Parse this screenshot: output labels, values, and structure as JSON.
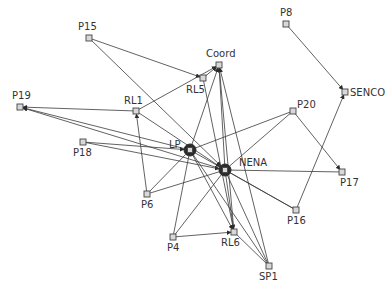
{
  "diagram": {
    "type": "directed-network",
    "background": "#ffffff",
    "edge_color": "#3a3a3a",
    "node_fill": "#d8d8d8",
    "hub_color": "#2b2b2b",
    "nodes": [
      {
        "id": "P15",
        "label": "P15",
        "x": 89,
        "y": 38,
        "lx": 78,
        "ly": 30,
        "hub": false
      },
      {
        "id": "P8",
        "label": "P8",
        "x": 286,
        "y": 24,
        "lx": 280,
        "ly": 16,
        "hub": false
      },
      {
        "id": "Coord",
        "label": "Coord",
        "x": 219,
        "y": 65,
        "lx": 206,
        "ly": 57,
        "hub": false
      },
      {
        "id": "RL5",
        "label": "RL5",
        "x": 203,
        "y": 78,
        "lx": 186,
        "ly": 93,
        "hub": false
      },
      {
        "id": "SENCO",
        "label": "SENCO",
        "x": 345,
        "y": 92,
        "lx": 350,
        "ly": 96,
        "hub": false
      },
      {
        "id": "P19",
        "label": "P19",
        "x": 20,
        "y": 107,
        "lx": 12,
        "ly": 99,
        "hub": false
      },
      {
        "id": "RL1",
        "label": "RL1",
        "x": 136,
        "y": 111,
        "lx": 124,
        "ly": 104,
        "hub": false
      },
      {
        "id": "P20",
        "label": "P20",
        "x": 293,
        "y": 111,
        "lx": 297,
        "ly": 108,
        "hub": false
      },
      {
        "id": "P18",
        "label": "P18",
        "x": 83,
        "y": 142,
        "lx": 73,
        "ly": 156,
        "hub": false
      },
      {
        "id": "LP",
        "label": "LP",
        "x": 190,
        "y": 150,
        "lx": 169,
        "ly": 148,
        "hub": true
      },
      {
        "id": "NENA",
        "label": "NENA",
        "x": 225,
        "y": 170,
        "lx": 239,
        "ly": 166,
        "hub": true
      },
      {
        "id": "P6",
        "label": "P6",
        "x": 147,
        "y": 194,
        "lx": 141,
        "ly": 208,
        "hub": false
      },
      {
        "id": "P17",
        "label": "P17",
        "x": 342,
        "y": 172,
        "lx": 340,
        "ly": 186,
        "hub": false
      },
      {
        "id": "P16",
        "label": "P16",
        "x": 296,
        "y": 210,
        "lx": 287,
        "ly": 224,
        "hub": false
      },
      {
        "id": "P4",
        "label": "P4",
        "x": 173,
        "y": 237,
        "lx": 167,
        "ly": 251,
        "hub": false
      },
      {
        "id": "RL6",
        "label": "RL6",
        "x": 234,
        "y": 232,
        "lx": 221,
        "ly": 246,
        "hub": false
      },
      {
        "id": "SP1",
        "label": "SP1",
        "x": 269,
        "y": 266,
        "lx": 259,
        "ly": 280,
        "hub": false
      }
    ],
    "edges": [
      {
        "from": "P15",
        "to": "RL5",
        "arrow": true
      },
      {
        "from": "P15",
        "to": "NENA",
        "arrow": true
      },
      {
        "from": "P8",
        "to": "SENCO",
        "arrow": true
      },
      {
        "from": "RL1",
        "to": "Coord",
        "arrow": true
      },
      {
        "from": "RL5",
        "to": "Coord",
        "arrow": true
      },
      {
        "from": "RL5",
        "to": "RL6",
        "arrow": true
      },
      {
        "from": "RL1",
        "to": "P19",
        "arrow": true
      },
      {
        "from": "RL1",
        "to": "NENA",
        "arrow": true
      },
      {
        "from": "NENA",
        "to": "P19",
        "arrow": true
      },
      {
        "from": "LP",
        "to": "P19",
        "arrow": true
      },
      {
        "from": "P18",
        "to": "LP",
        "arrow": true
      },
      {
        "from": "P18",
        "to": "NENA",
        "arrow": true
      },
      {
        "from": "P6",
        "to": "RL1",
        "arrow": true
      },
      {
        "from": "P6",
        "to": "LP",
        "arrow": false
      },
      {
        "from": "P6",
        "to": "NENA",
        "arrow": false
      },
      {
        "from": "LP",
        "to": "Coord",
        "arrow": true
      },
      {
        "from": "NENA",
        "to": "Coord",
        "arrow": true
      },
      {
        "from": "RL6",
        "to": "Coord",
        "arrow": true
      },
      {
        "from": "SP1",
        "to": "Coord",
        "arrow": true
      },
      {
        "from": "P20",
        "to": "LP",
        "arrow": false
      },
      {
        "from": "P20",
        "to": "NENA",
        "arrow": false
      },
      {
        "from": "P20",
        "to": "P17",
        "arrow": true
      },
      {
        "from": "P16",
        "to": "SENCO",
        "arrow": true
      },
      {
        "from": "NENA",
        "to": "P17",
        "arrow": false
      },
      {
        "from": "LP",
        "to": "P16",
        "arrow": false
      },
      {
        "from": "NENA",
        "to": "P16",
        "arrow": false
      },
      {
        "from": "P4",
        "to": "RL6",
        "arrow": true
      },
      {
        "from": "P4",
        "to": "LP",
        "arrow": false
      },
      {
        "from": "P4",
        "to": "NENA",
        "arrow": false
      },
      {
        "from": "LP",
        "to": "RL6",
        "arrow": true
      },
      {
        "from": "NENA",
        "to": "RL6",
        "arrow": true
      },
      {
        "from": "RL6",
        "to": "SP1",
        "arrow": false
      },
      {
        "from": "NENA",
        "to": "SP1",
        "arrow": false
      },
      {
        "from": "LP",
        "to": "SP1",
        "arrow": false
      }
    ]
  }
}
